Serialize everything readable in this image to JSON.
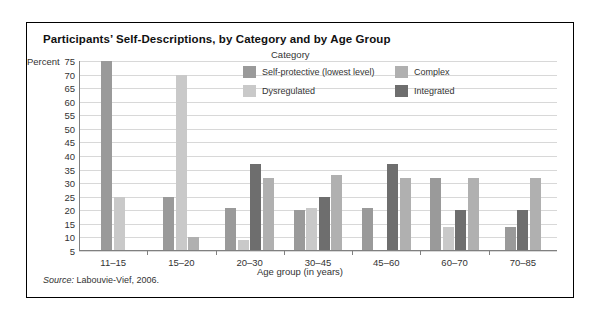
{
  "figure": {
    "title": "Participants’ Self-Descriptions, by Category and by Age Group",
    "source_prefix": "Source:",
    "source_text": "Labouvie-Vief, 2006."
  },
  "legend": {
    "title": "Category",
    "entries": [
      {
        "label": "Self-protective (lowest level)",
        "color": "#9a9a9a"
      },
      {
        "label": "Complex",
        "color": "#b0b0b0"
      },
      {
        "label": "Dysregulated",
        "color": "#c9c9c9"
      },
      {
        "label": "Integrated",
        "color": "#6e6e6e"
      }
    ]
  },
  "chart_data": {
    "type": "bar",
    "title": "Participants’ Self-Descriptions, by Category and by Age Group",
    "xlabel": "Age group (in years)",
    "ylabel": "Percent",
    "ylim": [
      5,
      75
    ],
    "yticks": [
      75,
      70,
      65,
      60,
      55,
      50,
      45,
      40,
      35,
      30,
      25,
      20,
      15,
      10,
      5
    ],
    "grid": true,
    "legend_position": "inside-top-center",
    "categories": [
      "11–15",
      "15–20",
      "20–30",
      "30–45",
      "45–60",
      "60–70",
      "70–85"
    ],
    "series": [
      {
        "name": "Self-protective (lowest level)",
        "color": "#9a9a9a",
        "values": [
          75,
          25,
          21,
          20,
          21,
          32,
          14
        ]
      },
      {
        "name": "Dysregulated",
        "color": "#c9c9c9",
        "values": [
          25,
          70,
          9,
          21,
          5,
          14,
          0
        ]
      },
      {
        "name": "Integrated",
        "color": "#6e6e6e",
        "values": [
          0,
          0,
          37,
          25,
          37,
          20,
          20
        ]
      },
      {
        "name": "Complex",
        "color": "#b0b0b0",
        "values": [
          0,
          10,
          32,
          33,
          32,
          32,
          32
        ]
      }
    ]
  }
}
